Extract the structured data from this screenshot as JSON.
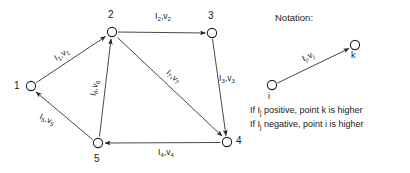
{
  "figure": {
    "type": "directed-graph-diagram",
    "background_color": "#ffffff",
    "line_color": "#222222",
    "node_fill": "#ffffff"
  },
  "graph": {
    "nodes": [
      {
        "id": "1",
        "label": "1",
        "x": 31,
        "y": 86,
        "label_x": 14,
        "label_y": 81
      },
      {
        "id": "2",
        "label": "2",
        "x": 112,
        "y": 32,
        "label_x": 108,
        "label_y": 10
      },
      {
        "id": "3",
        "label": "3",
        "x": 212,
        "y": 33,
        "label_x": 208,
        "label_y": 11
      },
      {
        "id": "4",
        "label": "4",
        "x": 227,
        "y": 142,
        "label_x": 236,
        "label_y": 136
      },
      {
        "id": "5",
        "label": "5",
        "x": 98,
        "y": 143,
        "label_x": 94,
        "label_y": 154
      }
    ],
    "edges": [
      {
        "from": "1",
        "to": "2",
        "current": "I",
        "sub": "1",
        "voltage": "v",
        "label": "I1,v1",
        "label_x": 62,
        "label_y": 55,
        "rotation": -33
      },
      {
        "from": "2",
        "to": "3",
        "current": "I",
        "sub": "2",
        "voltage": "v",
        "label": "I2,v2",
        "label_x": 163,
        "label_y": 17,
        "rotation": 0
      },
      {
        "from": "3",
        "to": "4",
        "current": "I",
        "sub": "3",
        "voltage": "v",
        "label": "I3,v3",
        "label_x": 227,
        "label_y": 79,
        "rotation": 0
      },
      {
        "from": "4",
        "to": "5",
        "current": "I",
        "sub": "4",
        "voltage": "v",
        "label": "I4,v4",
        "label_x": 166,
        "label_y": 153,
        "rotation": 0
      },
      {
        "from": "5",
        "to": "1",
        "current": "I",
        "sub": "5",
        "voltage": "v",
        "label": "I5,v5",
        "label_x": 47,
        "label_y": 120,
        "rotation": 25
      },
      {
        "from": "5",
        "to": "2",
        "current": "I",
        "sub": "6",
        "voltage": "v",
        "label": "I6,v6",
        "label_x": 95,
        "label_y": 88,
        "rotation": -78
      },
      {
        "from": "2",
        "to": "4",
        "current": "I",
        "sub": "7",
        "voltage": "v",
        "label": "I7,v7",
        "label_x": 173,
        "label_y": 77,
        "rotation": 42
      }
    ]
  },
  "notation": {
    "title": "Notation:",
    "title_x": 275,
    "title_y": 12,
    "from_node": "i",
    "to_node": "k",
    "from_x": 272,
    "from_y": 85,
    "to_x": 355,
    "to_y": 45,
    "edge_label": "Ij,vj",
    "edge_label_x": 308,
    "edge_label_y": 57,
    "edge_label_rotation": -26,
    "rule_positive_pre": "If I",
    "rule_sub": "j",
    "rule_positive_post": " positive, point k is higher",
    "rule_negative_pre": "If I",
    "rule_negative_post": " negative, point i is higher",
    "rule1_x": 250,
    "rule1_y": 105,
    "rule2_x": 250,
    "rule2_y": 119
  }
}
